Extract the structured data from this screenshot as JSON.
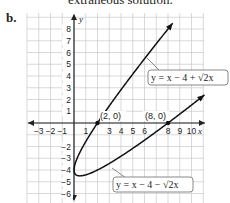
{
  "header": {
    "previous_text": "extraneous solution.",
    "part_label": "b."
  },
  "chart_data": {
    "type": "line",
    "title": "",
    "xlabel": "x",
    "ylabel": "y",
    "xlim": [
      -4,
      11
    ],
    "ylim": [
      -6.8,
      9.4
    ],
    "grid": true,
    "x_ticks": [
      "-3",
      "-2",
      "-1",
      "1",
      "3",
      "4",
      "5",
      "6",
      "8",
      "9",
      "10"
    ],
    "y_ticks": [
      "8",
      "7",
      "6",
      "5",
      "4",
      "3",
      "2",
      "1",
      "-2",
      "-3",
      "-4",
      "-5",
      "-6"
    ],
    "series": [
      {
        "name": "y = x − 4 + √2x",
        "equation": "y = x - 4 + sqrt(2x)",
        "domain": [
          0,
          10.5
        ]
      },
      {
        "name": "y = x − 4 − √2x",
        "equation": "y = x - 4 - sqrt(2x)",
        "domain": [
          0,
          10.5
        ]
      }
    ],
    "annotations": [
      {
        "label": "(2, 0)",
        "x": 2,
        "y": 0
      },
      {
        "label": "(8, 0)",
        "x": 8,
        "y": 0
      }
    ]
  },
  "labels": {
    "upper_curve": "y = x − 4 + √2x",
    "lower_curve": "y = x − 4 − √2x",
    "point_a": "(2, 0)",
    "point_b": "(8, 0)",
    "x_axis": "x",
    "y_axis": "y"
  }
}
